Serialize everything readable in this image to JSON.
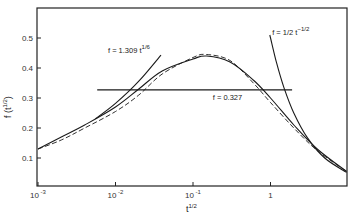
{
  "chart_data": {
    "type": "line",
    "title": "",
    "xlabel": "t^{1/2}",
    "ylabel": "f (t^{1/2})",
    "xscale": "log",
    "xlim": [
      0.001,
      9.6
    ],
    "ylim": [
      0.0,
      0.59
    ],
    "grid": false,
    "legend": null,
    "x_ticks": [
      {
        "value": 0.001,
        "label": "10",
        "exp": "-3"
      },
      {
        "value": 0.01,
        "label": "10",
        "exp": "-2"
      },
      {
        "value": 0.1,
        "label": "10",
        "exp": "-1"
      },
      {
        "value": 1,
        "label": "1",
        "exp": ""
      }
    ],
    "y_ticks": [
      {
        "value": 0.1,
        "label": "0.1"
      },
      {
        "value": 0.2,
        "label": "0.2"
      },
      {
        "value": 0.3,
        "label": "0.3"
      },
      {
        "value": 0.4,
        "label": "0.4"
      },
      {
        "value": 0.5,
        "label": "0.5"
      }
    ],
    "series": [
      {
        "name": "f (solid)",
        "style": "solid",
        "x": [
          0.001,
          0.002,
          0.004,
          0.01,
          0.02,
          0.04,
          0.1,
          0.15,
          0.3,
          0.6,
          1,
          2,
          4,
          9.6
        ],
        "y": [
          0.13,
          0.17,
          0.21,
          0.27,
          0.33,
          0.39,
          0.43,
          0.44,
          0.42,
          0.36,
          0.3,
          0.21,
          0.13,
          0.055
        ]
      },
      {
        "name": "f (dashed)",
        "style": "dashed",
        "x": [
          0.001,
          0.002,
          0.004,
          0.01,
          0.02,
          0.04,
          0.1,
          0.15,
          0.3,
          0.6,
          1,
          2,
          4,
          9.6
        ],
        "y": [
          0.13,
          0.16,
          0.2,
          0.255,
          0.31,
          0.38,
          0.435,
          0.445,
          0.425,
          0.35,
          0.285,
          0.2,
          0.125,
          0.055
        ]
      },
      {
        "name": "f = 1.309 t^{1/6}",
        "style": "solid",
        "x": [
          0.0055,
          0.01,
          0.02,
          0.0386
        ],
        "y": [
          0.231,
          0.282,
          0.356,
          0.443
        ]
      },
      {
        "name": "f = 0.327",
        "style": "solid",
        "x": [
          0.0058,
          1.9
        ],
        "y": [
          0.327,
          0.327
        ]
      },
      {
        "name": "f = 1/2 t^{-1/2}",
        "style": "solid",
        "x": [
          0.98,
          1.2,
          1.5,
          2,
          3,
          5,
          9.6
        ],
        "y": [
          0.51,
          0.417,
          0.333,
          0.25,
          0.167,
          0.1,
          0.052
        ]
      }
    ],
    "annotations": [
      {
        "text": "f = 1.309 t",
        "sup": "1/6",
        "x": 0.008,
        "y": 0.45
      },
      {
        "text": "f = 0.327",
        "x": 0.18,
        "y": 0.295
      },
      {
        "text": "f = 1/2 t",
        "sup": "−1/2",
        "x": 1.05,
        "y": 0.51
      }
    ]
  },
  "labels": {
    "xlabel_base": "t",
    "xlabel_sup": "1/2",
    "ylabel": "f (t",
    "ylabel_sup": "1/2",
    "ylabel_close": ")"
  }
}
